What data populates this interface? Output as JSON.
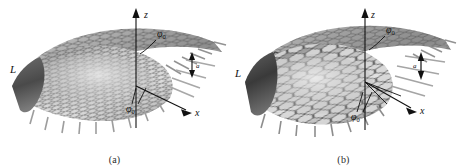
{
  "figure": {
    "background_color": "#ffffff",
    "ink_color": "#111111",
    "panels": [
      {
        "id": "a",
        "caption": "(a)",
        "labels": {
          "z_axis": "z",
          "x_axis": "x",
          "length": "L",
          "spacing": "a",
          "phi_upper": "φ",
          "phi_upper_sub": "0",
          "phi_lower": "φ",
          "phi_lower_sub": "0"
        },
        "description": "Grayscale 3D rendering of a hexagonal graphene-like lattice sheet curved into a shallow cone, viewed obliquely, with vertical z axis through the apex and x axis directed to the lower right.",
        "surface": {
          "shading": "grayscale",
          "light_tone": "#dcdcdc",
          "mid_tone": "#9a9a9a",
          "dark_tone": "#5c5c5c",
          "edge_tone": "#3a3a3a",
          "cell_shape": "hexagon",
          "cone_openness": "narrow"
        }
      },
      {
        "id": "b",
        "caption": "(b)",
        "labels": {
          "z_axis": "z",
          "x_axis": "x",
          "length": "L",
          "spacing": "a",
          "phi_upper": "φ",
          "phi_upper_sub": "0",
          "phi_lower": "φ",
          "phi_lower_sub": "0"
        },
        "description": "Grayscale 3D rendering of a hexagonal graphene-like lattice sheet curved into a wider, more open cone with larger visible hexagons on the near flank, vertical z axis through the apex and x axis directed to the lower right.",
        "surface": {
          "shading": "grayscale",
          "light_tone": "#e4e4e4",
          "mid_tone": "#8f8f8f",
          "dark_tone": "#4e4e4e",
          "edge_tone": "#2e2e2e",
          "cell_shape": "hexagon",
          "cone_openness": "wide"
        }
      }
    ]
  }
}
